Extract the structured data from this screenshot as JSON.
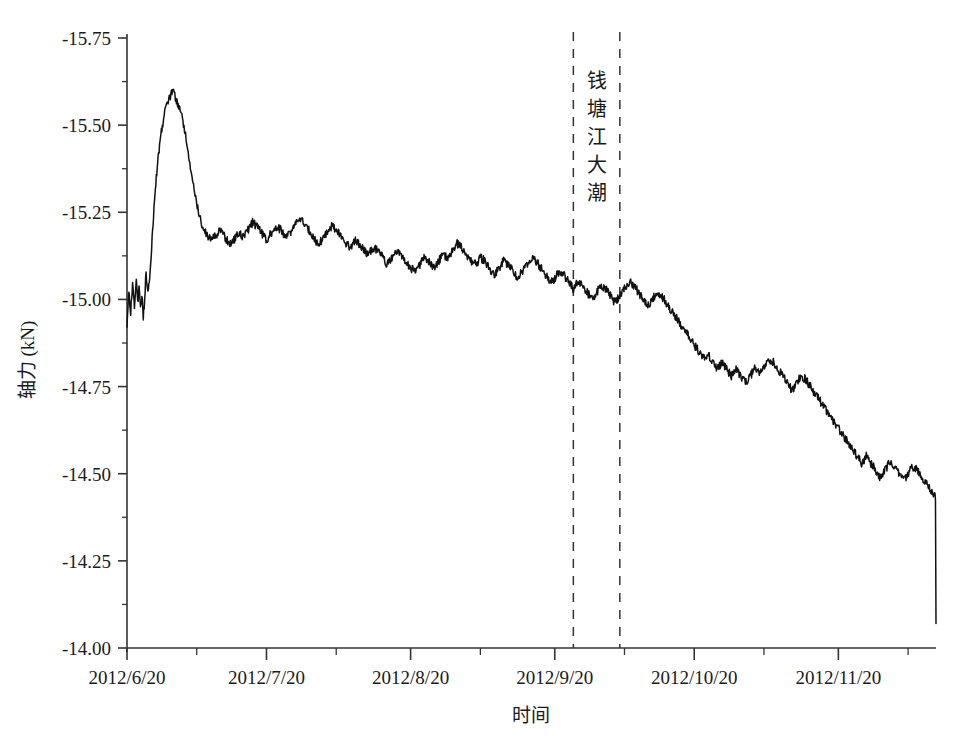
{
  "chart_data": {
    "type": "line",
    "title": "",
    "xlabel": "时间",
    "ylabel": "轴力 (kN)",
    "ylim": [
      -15.75,
      -14.0
    ],
    "ytick_labels": [
      "-15.75",
      "-15.50",
      "-15.25",
      "-15.00",
      "-14.75",
      "-14.50",
      "-14.25",
      "-14.00"
    ],
    "ytick_values": [
      -15.75,
      -15.5,
      -15.25,
      -15.0,
      -14.75,
      -14.5,
      -14.25,
      -14.0
    ],
    "y_axis_inverted": true,
    "xtick_labels": [
      "2012/6/20",
      "2012/7/20",
      "2012/8/20",
      "2012/9/20",
      "2012/10/20",
      "2012/11/20"
    ],
    "xtick_days": [
      0,
      30,
      61,
      92,
      122,
      153
    ],
    "xlim_days": [
      0,
      174
    ],
    "minor_xticks_days": [
      15,
      45,
      76,
      107,
      137,
      168
    ],
    "grid": false,
    "legend": null,
    "line_color": "#111111",
    "series": [
      {
        "name": "轴力",
        "units": "kN",
        "x_days": [
          0,
          0.4,
          0.8,
          1.2,
          1.6,
          2,
          2.3,
          2.6,
          2.9,
          3.2,
          3.5,
          3.8,
          4.1,
          4.4,
          4.8,
          5.2,
          5.6,
          6,
          6.5,
          7,
          7.5,
          8,
          8.6,
          9.2,
          9.8,
          10.4,
          11,
          11.8,
          12.6,
          13.4,
          14.2,
          15,
          16,
          17,
          18,
          19,
          20,
          21,
          22,
          23,
          24,
          25,
          26,
          27,
          28,
          29,
          30,
          31,
          32,
          33,
          34,
          35,
          36,
          37,
          38,
          39,
          40,
          41,
          42,
          43,
          44,
          45,
          46,
          47,
          48,
          49,
          50,
          51,
          52,
          53,
          54,
          55,
          56,
          57,
          58,
          59,
          60,
          61,
          62,
          63,
          64,
          65,
          66,
          67,
          68,
          69,
          70,
          71,
          72,
          73,
          74,
          75,
          76,
          77,
          78,
          79,
          80,
          81,
          82,
          83,
          84,
          85,
          86,
          87,
          88,
          89,
          90,
          91,
          92,
          93,
          94,
          95,
          96,
          97,
          98,
          99,
          100,
          101,
          102,
          103,
          104,
          105,
          106,
          107,
          108,
          109,
          110,
          111,
          112,
          113,
          114,
          115,
          116,
          117,
          118,
          119,
          120,
          121,
          122,
          123,
          124,
          125,
          126,
          127,
          128,
          129,
          130,
          131,
          132,
          133,
          134,
          135,
          136,
          137,
          138,
          139,
          140,
          141,
          142,
          143,
          144,
          145,
          146,
          147,
          148,
          149,
          150,
          151,
          152,
          153,
          154,
          155,
          156,
          157,
          158,
          159,
          160,
          161,
          162,
          163,
          164,
          165,
          166,
          167,
          168,
          169,
          170,
          171,
          172,
          173,
          174
        ],
        "y_values": [
          -14.93,
          -15.02,
          -14.96,
          -15.05,
          -14.98,
          -15.06,
          -14.99,
          -15.03,
          -14.97,
          -15.01,
          -14.95,
          -15.0,
          -15.08,
          -15.02,
          -15.05,
          -15.12,
          -15.22,
          -15.3,
          -15.38,
          -15.44,
          -15.49,
          -15.53,
          -15.56,
          -15.58,
          -15.6,
          -15.58,
          -15.56,
          -15.53,
          -15.47,
          -15.4,
          -15.33,
          -15.27,
          -15.22,
          -15.19,
          -15.17,
          -15.18,
          -15.2,
          -15.18,
          -15.16,
          -15.17,
          -15.19,
          -15.18,
          -15.2,
          -15.22,
          -15.21,
          -15.19,
          -15.17,
          -15.19,
          -15.21,
          -15.2,
          -15.18,
          -15.19,
          -15.21,
          -15.23,
          -15.22,
          -15.2,
          -15.18,
          -15.16,
          -15.17,
          -15.19,
          -15.21,
          -15.2,
          -15.18,
          -15.16,
          -15.15,
          -15.17,
          -15.16,
          -15.14,
          -15.13,
          -15.15,
          -15.14,
          -15.12,
          -15.1,
          -15.12,
          -15.14,
          -15.13,
          -15.11,
          -15.09,
          -15.08,
          -15.1,
          -15.12,
          -15.11,
          -15.09,
          -15.11,
          -15.13,
          -15.12,
          -15.14,
          -15.16,
          -15.15,
          -15.13,
          -15.11,
          -15.1,
          -15.12,
          -15.11,
          -15.09,
          -15.07,
          -15.09,
          -15.11,
          -15.1,
          -15.08,
          -15.06,
          -15.08,
          -15.1,
          -15.12,
          -15.11,
          -15.09,
          -15.07,
          -15.05,
          -15.06,
          -15.08,
          -15.07,
          -15.05,
          -15.03,
          -15.05,
          -15.04,
          -15.02,
          -15.0,
          -15.02,
          -15.04,
          -15.03,
          -15.01,
          -14.99,
          -15.01,
          -15.03,
          -15.05,
          -15.04,
          -15.02,
          -15.0,
          -14.98,
          -15.0,
          -15.02,
          -15.01,
          -14.99,
          -14.97,
          -14.95,
          -14.93,
          -14.91,
          -14.89,
          -14.87,
          -14.85,
          -14.83,
          -14.84,
          -14.82,
          -14.8,
          -14.82,
          -14.8,
          -14.78,
          -14.8,
          -14.78,
          -14.76,
          -14.78,
          -14.8,
          -14.79,
          -14.81,
          -14.83,
          -14.82,
          -14.8,
          -14.78,
          -14.76,
          -14.74,
          -14.76,
          -14.78,
          -14.77,
          -14.75,
          -14.73,
          -14.71,
          -14.69,
          -14.67,
          -14.65,
          -14.63,
          -14.61,
          -14.59,
          -14.57,
          -14.55,
          -14.53,
          -14.55,
          -14.53,
          -14.51,
          -14.49,
          -14.51,
          -14.53,
          -14.52,
          -14.5,
          -14.48,
          -14.5,
          -14.52,
          -14.51,
          -14.49,
          -14.47,
          -14.45,
          -14.43,
          -14.41,
          -14.39,
          -14.37,
          -14.35,
          -14.33,
          -14.31,
          -14.29,
          -14.27,
          -14.25,
          -14.23,
          -14.21,
          -14.19,
          -14.17,
          -14.15,
          -14.13,
          -14.12,
          -14.14,
          -14.13,
          -14.15,
          -14.14,
          -14.12,
          -14.13,
          -14.15,
          -14.14,
          -14.16,
          -14.15,
          -14.13,
          -14.12,
          -14.1,
          -14.08,
          -14.06,
          -14.05,
          -14.03,
          -14.04,
          -14.06,
          -14.07
        ]
      }
    ],
    "annotations": [
      {
        "name": "qiantang-tide-band",
        "text": "钱塘江大潮",
        "characters": [
          "钱",
          "塘",
          "江",
          "大",
          "潮"
        ],
        "line_style": "dashed",
        "line_color": "#333333",
        "x_start_day": 96,
        "x_end_day": 106
      }
    ]
  },
  "figure": {
    "background_color": "#ffffff",
    "axis_color": "#333333",
    "noise_amplitude_kn": 0.012
  }
}
